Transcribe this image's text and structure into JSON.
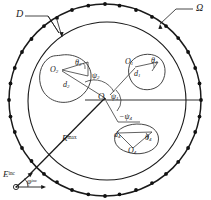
{
  "figure": {
    "name": "scattering-geometry-diagram",
    "width": 211,
    "height": 200,
    "background": "#ffffff",
    "stroke_color": "#1a1a1a"
  },
  "labels": {
    "omega": "Ω",
    "domain_d": "D",
    "origin": "O",
    "r_max_base": "R",
    "r_max_exp": "max",
    "e_inc_base": "E",
    "e_inc_exp": "inc",
    "phi_inc_base": "φ",
    "phi_inc_exp": "inc",
    "o1_base": "O",
    "o1_sub": "1",
    "o2_base": "O",
    "o2_sub": "2",
    "o4_base": "O",
    "o4_sub": "4",
    "d1_base": "d",
    "d1_sub": "1",
    "d2_base": "d",
    "d2_sub": "2",
    "d4_base": "d",
    "d4_sub": "4",
    "theta1_base": "θ",
    "theta1_sub": "1",
    "theta2_base": "θ",
    "theta2_sub": "2",
    "theta4_base": "θ",
    "theta4_sub": "4",
    "psi1_base": "ψ",
    "psi1_sub": "1",
    "psi2_base": "ψ",
    "psi2_sub": "2",
    "psi4_base": "−ψ",
    "psi4_sub": "4"
  },
  "geometry": {
    "outer_circle": {
      "label": "Ω",
      "cx": 105,
      "cy": 100,
      "r": 96,
      "marker_count": 36,
      "marker_radius": 1.9,
      "dashed": false
    },
    "inner_circle": {
      "label": "D",
      "cx": 107,
      "cy": 101,
      "r": 79
    },
    "center_point": {
      "label": "O",
      "x": 105,
      "y": 98
    },
    "r_max_line": {
      "label_base": "R",
      "label_exp": "max",
      "from_x": 105,
      "from_y": 98,
      "to_x": 33,
      "to_y": 172
    },
    "reference_axis": {
      "from_x": 105,
      "from_y": 100,
      "to_x": 201,
      "to_y": 100
    },
    "incident_wave": {
      "base": "E",
      "exp": "inc",
      "angle_base": "φ",
      "angle_exp": "inc",
      "x": 10,
      "y": 172
    }
  },
  "scatterers": [
    {
      "id": "scatterer-1",
      "center_label": "O",
      "center_sub": "1",
      "dist_label": "d",
      "dist_sub": "1",
      "theta_label": "θ",
      "theta_sub": "1",
      "psi_label": "ψ",
      "psi_sub": "1",
      "cx": 143,
      "cy": 72,
      "rx": 19,
      "ry": 15,
      "rot": -20
    },
    {
      "id": "scatterer-2",
      "center_label": "O",
      "center_sub": "2",
      "dist_label": "d",
      "dist_sub": "2",
      "theta_label": "θ",
      "theta_sub": "2",
      "psi_label": "ψ",
      "psi_sub": "2",
      "cx": 66,
      "cy": 78,
      "rx": 25,
      "ry": 22,
      "rot": 10
    },
    {
      "id": "scatterer-4",
      "center_label": "O",
      "center_sub": "4",
      "dist_label": "d",
      "dist_sub": "4",
      "theta_label": "θ",
      "theta_sub": "4",
      "psi_label": "−ψ",
      "psi_sub": "4",
      "cx": 133,
      "cy": 138,
      "rx": 22,
      "ry": 14,
      "rot": 8
    }
  ]
}
